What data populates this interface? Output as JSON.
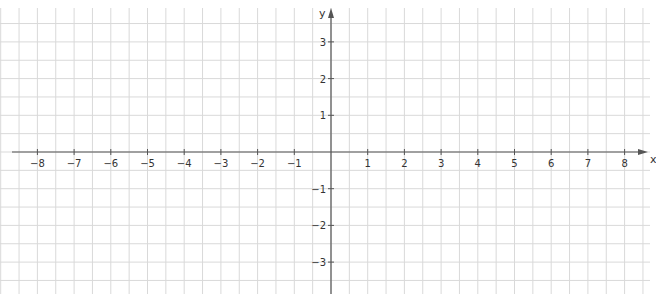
{
  "chart_data": {
    "type": "cartesian-grid",
    "title": "",
    "xlabel": "x",
    "ylabel": "y",
    "xlim": [
      -8,
      8
    ],
    "ylim": [
      -3,
      3
    ],
    "x_ticks": [
      -8,
      -7,
      -6,
      -5,
      -4,
      -3,
      -2,
      -1,
      1,
      2,
      3,
      4,
      5,
      6,
      7,
      8
    ],
    "x_tick_labels": [
      "−8",
      "−7",
      "−6",
      "−5",
      "−4",
      "−3",
      "−2",
      "−1",
      "1",
      "2",
      "3",
      "4",
      "5",
      "6",
      "7",
      "8"
    ],
    "y_ticks": [
      3,
      2,
      1,
      -1,
      -2,
      -3
    ],
    "y_tick_labels": [
      "3",
      "2",
      "1",
      "−1",
      "−2",
      "−3"
    ],
    "grid": true,
    "grid_step": 0.5,
    "series": []
  },
  "style": {
    "grid_color": "#d9d9d9",
    "axis_color": "#555555",
    "label_color": "#333333"
  },
  "layout": {
    "origin_x": 331,
    "origin_y": 152,
    "unit_px": 36.7,
    "x_axis_start": 12,
    "x_axis_end": 648,
    "y_axis_top": 8,
    "y_axis_bottom": 294
  }
}
